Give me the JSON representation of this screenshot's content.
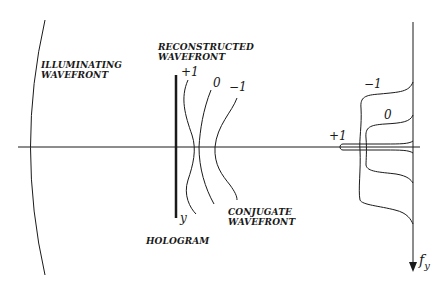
{
  "diagram": {
    "labels": {
      "illuminating": [
        "ILLUMINATING",
        "WAVEFRONT"
      ],
      "reconstructed": [
        "RECONSTRUCTED",
        "WAVEFRONT"
      ],
      "conjugate": [
        "CONJUGATE",
        "WAVEFRONT"
      ],
      "hologram": "HOLOGRAM",
      "hologram_axis": "y"
    },
    "wavefront_orders": {
      "plus_one": "+1",
      "zero": "0",
      "minus_one": "−1"
    },
    "spectrum_orders": {
      "plus_one": "+1",
      "zero": "0",
      "minus_one": "−1"
    },
    "frequency_axis": {
      "symbol": "f",
      "subscript": "y"
    },
    "colors": {
      "line": "#1a1a1a",
      "background": "#ffffff"
    }
  }
}
